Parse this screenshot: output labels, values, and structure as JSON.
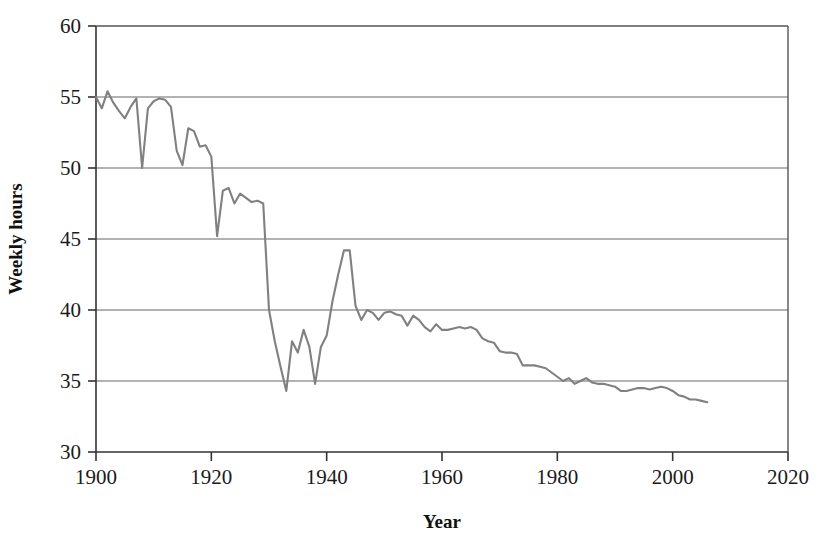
{
  "chart_data": {
    "type": "line",
    "title": "",
    "xlabel": "Year",
    "ylabel": "Weekly hours",
    "xlim": [
      1900,
      2020
    ],
    "ylim": [
      30,
      60
    ],
    "xticks": [
      1900,
      1920,
      1940,
      1960,
      1980,
      2000,
      2020
    ],
    "yticks": [
      30,
      35,
      40,
      45,
      50,
      55,
      60
    ],
    "xtick_labels": [
      "1900",
      "1920",
      "1940",
      "1960",
      "1980",
      "2000",
      "2020"
    ],
    "ytick_labels": [
      "30",
      "35",
      "40",
      "45",
      "50",
      "55",
      "60"
    ],
    "grid": "horizontal",
    "legend": "none",
    "series": [
      {
        "name": "Average weekly hours",
        "color": "#808080",
        "x": [
          1900,
          1901,
          1902,
          1903,
          1904,
          1905,
          1906,
          1907,
          1908,
          1909,
          1910,
          1911,
          1912,
          1913,
          1914,
          1915,
          1916,
          1917,
          1918,
          1919,
          1920,
          1921,
          1922,
          1923,
          1924,
          1925,
          1926,
          1927,
          1928,
          1929,
          1930,
          1931,
          1932,
          1933,
          1934,
          1935,
          1936,
          1937,
          1938,
          1939,
          1940,
          1941,
          1942,
          1943,
          1944,
          1945,
          1946,
          1947,
          1948,
          1949,
          1950,
          1951,
          1952,
          1953,
          1954,
          1955,
          1956,
          1957,
          1958,
          1959,
          1960,
          1961,
          1962,
          1963,
          1964,
          1965,
          1966,
          1967,
          1968,
          1969,
          1970,
          1971,
          1972,
          1973,
          1974,
          1975,
          1976,
          1977,
          1978,
          1979,
          1980,
          1981,
          1982,
          1983,
          1984,
          1985,
          1986,
          1987,
          1988,
          1989,
          1990,
          1991,
          1992,
          1993,
          1994,
          1995,
          1996,
          1997,
          1998,
          1999,
          2000,
          2001,
          2002,
          2003,
          2004,
          2005,
          2006
        ],
        "values": [
          55.0,
          54.2,
          55.4,
          54.6,
          54.0,
          53.5,
          54.3,
          54.9,
          50.0,
          54.2,
          54.7,
          54.9,
          54.8,
          54.3,
          51.2,
          50.2,
          52.8,
          52.6,
          51.5,
          51.6,
          50.8,
          45.2,
          48.4,
          48.6,
          47.5,
          48.2,
          47.9,
          47.6,
          47.7,
          47.5,
          40.0,
          37.8,
          36.0,
          34.3,
          37.8,
          37.0,
          38.6,
          37.4,
          34.8,
          37.4,
          38.2,
          40.6,
          42.5,
          44.2,
          44.2,
          40.3,
          39.3,
          40.0,
          39.8,
          39.3,
          39.8,
          39.9,
          39.7,
          39.6,
          38.9,
          39.6,
          39.3,
          38.8,
          38.5,
          39.0,
          38.6,
          38.6,
          38.7,
          38.8,
          38.7,
          38.8,
          38.6,
          38.0,
          37.8,
          37.7,
          37.1,
          37.0,
          37.0,
          36.9,
          36.1,
          36.1,
          36.1,
          36.0,
          35.9,
          35.6,
          35.3,
          35.0,
          35.2,
          34.8,
          35.0,
          35.2,
          34.9,
          34.8,
          34.8,
          34.7,
          34.6,
          34.3,
          34.3,
          34.4,
          34.5,
          34.5,
          34.4,
          34.5,
          34.6,
          34.5,
          34.3,
          34.0,
          33.9,
          33.7,
          33.7,
          33.6,
          33.5
        ]
      }
    ]
  },
  "axes": {
    "x_title": "Year",
    "y_title": "Weekly hours"
  }
}
